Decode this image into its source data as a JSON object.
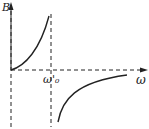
{
  "diagram": {
    "y_axis_label": "B",
    "x_axis_label": "ω",
    "marker_label": "ω'₀",
    "colors": {
      "line": "#222222",
      "background": "#ffffff"
    }
  }
}
